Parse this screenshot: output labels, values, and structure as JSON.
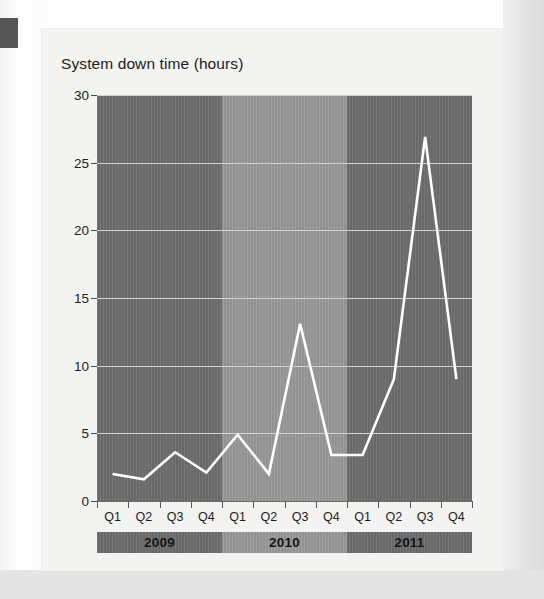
{
  "chart_data": {
    "type": "line",
    "title": "System down time (hours)",
    "xlabel": "",
    "ylabel": "",
    "ylim": [
      0,
      30
    ],
    "yticks": [
      0,
      5,
      10,
      15,
      20,
      25,
      30
    ],
    "ytick_labels": [
      "0",
      "5",
      "10",
      "15",
      "20",
      "25",
      "30"
    ],
    "grid": true,
    "legend": "none",
    "categories": [
      "Q1",
      "Q2",
      "Q3",
      "Q4",
      "Q1",
      "Q2",
      "Q3",
      "Q4",
      "Q1",
      "Q2",
      "Q3",
      "Q4"
    ],
    "values": [
      2.0,
      1.6,
      3.6,
      2.1,
      4.9,
      2.0,
      13.1,
      3.4,
      3.4,
      9.0,
      26.9,
      9.0
    ],
    "series": [
      {
        "name": "System down time",
        "color": "#ffffff",
        "values": [
          2.0,
          1.6,
          3.6,
          2.1,
          4.9,
          2.0,
          13.1,
          3.4,
          3.4,
          9.0,
          26.9,
          9.0
        ]
      }
    ],
    "groups": [
      {
        "label": "2009",
        "quarters": [
          "Q1",
          "Q2",
          "Q3",
          "Q4"
        ],
        "shade": "dark"
      },
      {
        "label": "2010",
        "quarters": [
          "Q1",
          "Q2",
          "Q3",
          "Q4"
        ],
        "shade": "light"
      },
      {
        "label": "2011",
        "quarters": [
          "Q1",
          "Q2",
          "Q3",
          "Q4"
        ],
        "shade": "dark"
      }
    ],
    "colors": {
      "band_dark": "#6e6e6f",
      "band_light": "#9a9a9b",
      "line": "#ffffff",
      "gridline": "#d2d2d2",
      "panel": "#f3f3f2",
      "text": "#1d1d1d"
    }
  }
}
